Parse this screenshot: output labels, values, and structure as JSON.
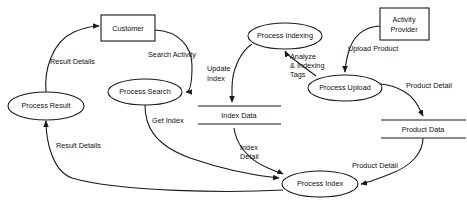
{
  "diagram": {
    "type": "data-flow-diagram",
    "canvas": {
      "width": 467,
      "height": 210,
      "background": "#ffffff"
    },
    "stroke_color": "#1a1a1a",
    "text_color": "#111111",
    "entities": [
      {
        "id": "customer",
        "label": "Customer",
        "shape": "rectangle"
      },
      {
        "id": "activity_provider",
        "label_line1": "Activity",
        "label_line2": "Provider",
        "label": "Activity Provider",
        "shape": "rectangle"
      }
    ],
    "processes": [
      {
        "id": "process_result",
        "label": "Process Result",
        "shape": "ellipse"
      },
      {
        "id": "process_search",
        "label": "Process Search",
        "shape": "ellipse"
      },
      {
        "id": "process_indexing",
        "label": "Process Indexing",
        "shape": "ellipse"
      },
      {
        "id": "process_upload",
        "label": "Process Upload",
        "shape": "ellipse"
      },
      {
        "id": "process_index",
        "label": "Process Index",
        "shape": "ellipse"
      }
    ],
    "data_stores": [
      {
        "id": "index_data",
        "label": "Index Data",
        "shape": "open-ended-rectangle"
      },
      {
        "id": "product_data",
        "label": "Product Data",
        "shape": "open-ended-rectangle"
      }
    ],
    "flows": [
      {
        "id": "result_details_to_customer",
        "label": "Result Details",
        "from": "process_result",
        "to": "customer"
      },
      {
        "id": "search_activity",
        "label": "Search Activity",
        "from": "customer",
        "to": "process_search"
      },
      {
        "id": "get_index",
        "label": "Get Index",
        "from": "process_search",
        "to": "process_index"
      },
      {
        "id": "result_details_to_process_result",
        "label": "Result Details",
        "from": "process_index",
        "to": "process_result"
      },
      {
        "id": "update_index",
        "label_line1": "Update",
        "label_line2": "Index",
        "label": "Update Index",
        "from": "process_indexing",
        "to": "index_data"
      },
      {
        "id": "analyze_indexing_tags",
        "label_line1": "Analyze",
        "label_line2": "& Indexing",
        "label_line3": "Tags",
        "label": "Analyze & Indexing Tags",
        "from": "process_upload",
        "to": "process_indexing"
      },
      {
        "id": "upload_product",
        "label": "Upload Product",
        "from": "activity_provider",
        "to": "process_upload"
      },
      {
        "id": "product_detail_to_store",
        "label": "Product Detail",
        "from": "process_upload",
        "to": "product_data"
      },
      {
        "id": "product_detail_to_index",
        "label": "Product Detail",
        "from": "product_data",
        "to": "process_index"
      },
      {
        "id": "index_detail",
        "label_line1": "Index",
        "label_line2": "Detail",
        "label": "Index Detail",
        "from": "index_data",
        "to": "process_index"
      }
    ]
  }
}
